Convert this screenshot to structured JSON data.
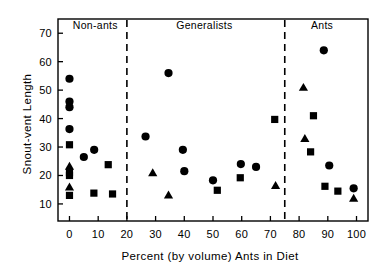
{
  "chart_data": {
    "type": "scatter",
    "title": "",
    "xlabel": "Percent (by volume) Ants in Diet",
    "ylabel": "Snout-vent Length",
    "xlim": [
      -4,
      104
    ],
    "ylim": [
      4,
      75
    ],
    "xticks": [
      0,
      10,
      20,
      30,
      40,
      50,
      60,
      70,
      80,
      90,
      100
    ],
    "xtick_labels": [
      "0",
      "10",
      "20",
      "30",
      "40",
      "50",
      "60",
      "70",
      "80",
      "90",
      "100"
    ],
    "yticks": [
      10,
      20,
      30,
      40,
      50,
      60,
      70
    ],
    "ytick_labels": [
      "10",
      "20",
      "30",
      "40",
      "50",
      "60",
      "70"
    ],
    "grid": false,
    "legend": "none",
    "marker_color": "#000000",
    "frame_color": "#000000",
    "annotations": [
      {
        "text": "Non-ants",
        "x": 9,
        "y": 72.5
      },
      {
        "text": "Generalists",
        "x": 47,
        "y": 72.5
      },
      {
        "text": "Ants",
        "x": 88,
        "y": 72.5
      }
    ],
    "dividers": [
      {
        "x": 20,
        "style": "dashed"
      },
      {
        "x": 75,
        "style": "dashed"
      }
    ],
    "series": [
      {
        "name": "circle",
        "marker": "circle",
        "points": [
          [
            0.0,
            54.0
          ],
          [
            0.0,
            46.0
          ],
          [
            0.0,
            44.0
          ],
          [
            0.0,
            36.3
          ],
          [
            5.0,
            26.5
          ],
          [
            8.6,
            29.0
          ],
          [
            26.5,
            33.7
          ],
          [
            34.5,
            56.0
          ],
          [
            39.5,
            29.0
          ],
          [
            40.0,
            21.5
          ],
          [
            50.0,
            18.3
          ],
          [
            59.7,
            24.0
          ],
          [
            65.0,
            23.0
          ],
          [
            88.6,
            64.0
          ],
          [
            90.5,
            23.5
          ],
          [
            99.0,
            15.5
          ]
        ]
      },
      {
        "name": "square",
        "marker": "square",
        "points": [
          [
            0.0,
            30.8
          ],
          [
            0.0,
            21.0
          ],
          [
            0.0,
            20.0
          ],
          [
            0.0,
            13.0
          ],
          [
            8.5,
            13.8
          ],
          [
            13.5,
            23.8
          ],
          [
            15.0,
            13.5
          ],
          [
            51.5,
            14.8
          ],
          [
            59.5,
            19.2
          ],
          [
            71.5,
            39.7
          ],
          [
            85.0,
            41.0
          ],
          [
            84.0,
            28.3
          ],
          [
            89.0,
            16.2
          ],
          [
            93.5,
            14.5
          ]
        ]
      },
      {
        "name": "triangle",
        "marker": "triangle",
        "points": [
          [
            0.0,
            23.3
          ],
          [
            0.0,
            16.0
          ],
          [
            29.0,
            21.0
          ],
          [
            34.5,
            13.2
          ],
          [
            71.8,
            16.5
          ],
          [
            81.5,
            51.0
          ],
          [
            82.0,
            33.0
          ],
          [
            99.0,
            12.0
          ]
        ]
      }
    ]
  }
}
